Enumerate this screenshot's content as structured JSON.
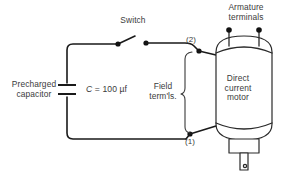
{
  "diagram": {
    "background_color": "#ffffff",
    "line_color": "#1a1a1a",
    "text_color": "#3b3b3b"
  },
  "labels": {
    "switch": "Switch",
    "armature_terminals": "Armature\nterminals",
    "precharged_capacitor": "Precharged\ncapacitor",
    "capacitor_value_symbol": "C",
    "capacitor_value_rest": " = 100 µf",
    "field_terminals": "Field\nterm'ls.",
    "motor": "Direct\ncurrent\nmotor",
    "node_2": "(2)",
    "node_1": "(1)"
  },
  "components": {
    "capacitor": {
      "name": "capacitor-symbol",
      "value": "100 µf",
      "designator": "C"
    },
    "switch": {
      "name": "knife-switch",
      "state": "open"
    },
    "motor": {
      "name": "dc-motor",
      "type": "Direct current motor"
    },
    "armature_terminal_count": 2,
    "field_terminal_nodes": [
      "(1)",
      "(2)"
    ]
  }
}
